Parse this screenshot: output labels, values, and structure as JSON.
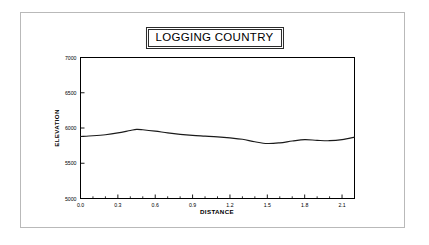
{
  "figure": {
    "background_color": "#ffffff",
    "frame_color": "#b9b9b9",
    "axis_color": "#000000",
    "line_color": "#1a1a1a"
  },
  "chart_data": {
    "type": "line",
    "title": "LOGGING COUNTRY",
    "xlabel": "DISTANCE",
    "ylabel": "ELEVATION",
    "xlim": [
      0.0,
      2.2
    ],
    "ylim": [
      5000,
      7000
    ],
    "grid": false,
    "legend": null,
    "x_ticks": [
      0.0,
      0.3,
      0.6,
      0.9,
      1.2,
      1.5,
      1.8,
      2.1
    ],
    "x_tick_labels": [
      "0.0",
      "0.3",
      "0.6",
      "0.9",
      "1.2",
      "1.5",
      "1.8",
      "2.1"
    ],
    "x_minor_tick_interval": 0.1,
    "y_ticks": [
      5000,
      5500,
      6000,
      6500,
      7000
    ],
    "y_tick_labels": [
      "5000",
      "5500",
      "6000",
      "6500",
      "7000"
    ],
    "series": [
      {
        "name": "Elevation profile",
        "x": [
          0.0,
          0.1,
          0.2,
          0.3,
          0.4,
          0.45,
          0.5,
          0.6,
          0.7,
          0.8,
          0.9,
          1.0,
          1.1,
          1.2,
          1.3,
          1.4,
          1.5,
          1.6,
          1.7,
          1.8,
          1.9,
          2.0,
          2.1,
          2.2
        ],
        "y": [
          5880,
          5890,
          5905,
          5930,
          5965,
          5980,
          5975,
          5955,
          5930,
          5910,
          5895,
          5885,
          5875,
          5860,
          5840,
          5805,
          5780,
          5790,
          5815,
          5835,
          5825,
          5820,
          5835,
          5870
        ]
      }
    ]
  }
}
